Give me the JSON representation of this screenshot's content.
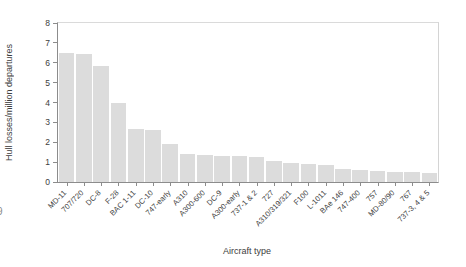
{
  "figure": {
    "background": "#ffffff"
  },
  "chart_data": {
    "type": "bar",
    "title": "",
    "xlabel": "Aircraft type",
    "ylabel": "Hull losses/million departures",
    "categories": [
      "MD-11",
      "707/720",
      "DC-8",
      "F-28",
      "BAC 1-11",
      "DC-10",
      "747-early",
      "A310",
      "A300-600",
      "DC-9",
      "A300-early",
      "737-1 & 2",
      "727",
      "A310/319/321",
      "F100",
      "L-1011",
      "BAe 146",
      "747-400",
      "757",
      "MD-80/90",
      "767",
      "737-3, 4 & 5"
    ],
    "values": [
      6.5,
      6.45,
      5.85,
      4.0,
      2.65,
      2.6,
      1.9,
      1.4,
      1.35,
      1.3,
      1.3,
      1.25,
      1.05,
      0.95,
      0.9,
      0.85,
      0.65,
      0.6,
      0.55,
      0.5,
      0.5,
      0.45
    ],
    "ylim": [
      0,
      8
    ],
    "yticks": [
      0,
      1,
      2,
      3,
      4,
      5,
      6,
      7,
      8
    ],
    "x_tick_rotation": -45,
    "grid": false,
    "legend": null,
    "bar_color": "#dcdcdc",
    "axis_color": "#8c8c8c",
    "frame_color": "#d8d8d8",
    "text_color": "#3d3d3d"
  },
  "artifacts": {
    "left_edge_glyph": "9"
  }
}
